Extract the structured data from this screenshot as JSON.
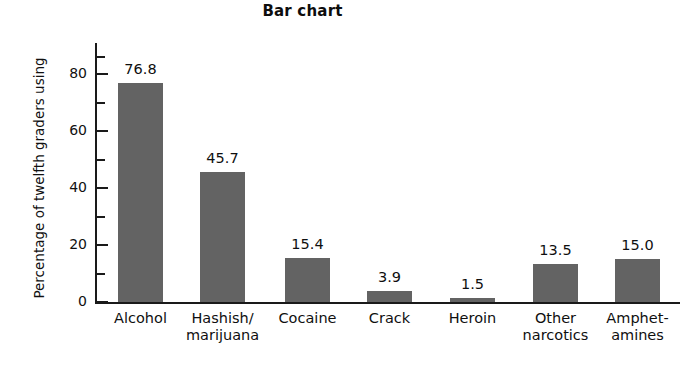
{
  "chart_data": {
    "type": "bar",
    "title": "Bar chart",
    "xlabel": "",
    "ylabel": "Percentage of twelfth graders using",
    "categories": [
      "Alcohol",
      "Hashish/ marijuana",
      "Cocaine",
      "Crack",
      "Heroin",
      "Other narcotics",
      "Amphet- amines"
    ],
    "category_lines": [
      [
        "Alcohol"
      ],
      [
        "Hashish/",
        "marijuana"
      ],
      [
        "Cocaine"
      ],
      [
        "Crack"
      ],
      [
        "Heroin"
      ],
      [
        "Other",
        "narcotics"
      ],
      [
        "Amphet-",
        "amines"
      ]
    ],
    "values": [
      76.8,
      45.7,
      15.4,
      3.9,
      1.5,
      13.5,
      15.0
    ],
    "value_labels": [
      "76.8",
      "45.7",
      "15.4",
      "3.9",
      "1.5",
      "13.5",
      "15.0"
    ],
    "ylim": [
      0,
      88
    ],
    "ytick_major": [
      0,
      20,
      40,
      60,
      80
    ],
    "ytick_major_labels": [
      "0",
      "20",
      "40",
      "60",
      "80"
    ],
    "ytick_minor": [
      10,
      30,
      50,
      70,
      86
    ],
    "grid": false,
    "legend": null,
    "bar_color": "#636363",
    "axis_color": "#1a1a1a",
    "text_color": "#111111",
    "background": "#ffffff"
  }
}
